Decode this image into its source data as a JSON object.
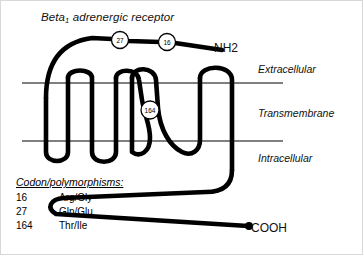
{
  "figure": {
    "title_prefix": "Beta",
    "title_subscript": "1",
    "title_suffix": " adrenergic receptor",
    "terminus_n": "NH2",
    "terminus_c": "COOH",
    "regions": {
      "extracellular": "Extracellular",
      "transmembrane": "Transmembrane",
      "intracellular": "Intracellular"
    },
    "markers": [
      {
        "label": "27",
        "cx": 120,
        "cy": 40
      },
      {
        "label": "16",
        "cx": 167,
        "cy": 42
      },
      {
        "label": "164",
        "cx": 150,
        "cy": 110
      }
    ]
  },
  "legend": {
    "title": "Codon/polymorphisms:",
    "rows": [
      {
        "codon": "16",
        "polymorphism": "Arg/Gly"
      },
      {
        "codon": "27",
        "polymorphism": "Gln/Glu"
      },
      {
        "codon": "164",
        "polymorphism": "Thr/Ile"
      }
    ]
  },
  "colors": {
    "background": "#ffffff",
    "chain": "#000000",
    "membrane_line": "#000000",
    "text": "#111111"
  }
}
